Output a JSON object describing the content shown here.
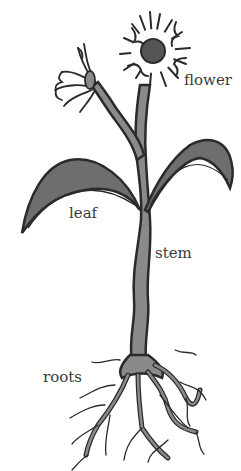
{
  "diagram": {
    "labels": {
      "flower": "flower",
      "leaf": "leaf",
      "stem": "stem",
      "roots": "roots"
    },
    "colors": {
      "outline": "#2a2a2a",
      "fill": "#8a8a8a",
      "leaf_fill": "#6e6e6e",
      "flower_center": "#555555",
      "label_text": "#3a3a3a",
      "background": "#ffffff"
    }
  }
}
